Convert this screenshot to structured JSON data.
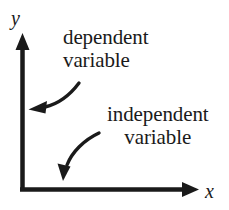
{
  "figure": {
    "name": "axis-variable-labels-diagram",
    "background_color": "#ffffff",
    "ink_color": "#1a1a1a"
  },
  "axes": {
    "y_label": "y",
    "x_label": "x",
    "y_axis_icon": "up-arrow-axis",
    "x_axis_icon": "right-arrow-axis"
  },
  "annotations": [
    {
      "id": "dependent",
      "line1": "dependent",
      "line2": "variable",
      "points_to": "y",
      "arrow_icon": "curved-arrow-down-left"
    },
    {
      "id": "independent",
      "line1": "independent",
      "line2": "variable",
      "points_to": "x",
      "arrow_icon": "curved-arrow-down-left"
    }
  ]
}
